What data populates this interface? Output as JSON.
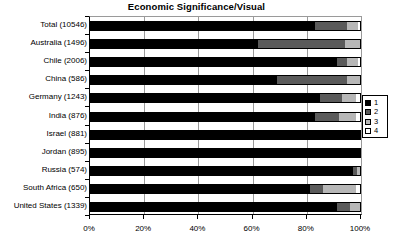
{
  "chart_data": {
    "type": "bar",
    "orientation": "horizontal",
    "stacked": true,
    "normalized_percent": true,
    "title": "Economic Significance/Visual",
    "xlabel": "",
    "ylabel": "",
    "xlim": [
      0,
      100
    ],
    "xticks": [
      0,
      20,
      40,
      60,
      80,
      100
    ],
    "xtick_labels": [
      "0%",
      "20%",
      "40%",
      "60%",
      "80%",
      "100%"
    ],
    "grid": true,
    "legend_position": "right",
    "legend_entries": [
      "1",
      "2",
      "3",
      "4"
    ],
    "series_colors": [
      "#000000",
      "#5a5a5a",
      "#b7b7b7",
      "#ffffff"
    ],
    "categories": [
      "Total (10546)",
      "Australia (1496)",
      "Chile (2006)",
      "China (586)",
      "Germany (1243)",
      "India (876)",
      "Israel (881)",
      "Jordan (895)",
      "Russia (574)",
      "South Africa (650)",
      "United States (1339)"
    ],
    "category_counts": [
      10546,
      1496,
      2006,
      586,
      1243,
      876,
      881,
      895,
      574,
      650,
      1339
    ],
    "series": [
      {
        "name": "1",
        "values": [
          83.0,
          62.0,
          91.0,
          69.0,
          85.0,
          83.0,
          99.5,
          99.5,
          97.0,
          81.0,
          91.0
        ]
      },
      {
        "name": "2",
        "values": [
          12.0,
          32.0,
          4.0,
          26.0,
          8.0,
          9.0,
          0.5,
          0.5,
          1.5,
          5.0,
          5.0
        ]
      },
      {
        "name": "3",
        "values": [
          4.0,
          6.0,
          4.0,
          5.0,
          5.0,
          6.0,
          0.0,
          0.0,
          1.0,
          12.0,
          3.5
        ]
      },
      {
        "name": "4",
        "values": [
          1.0,
          0.0,
          1.0,
          0.0,
          2.0,
          2.0,
          0.0,
          0.0,
          0.5,
          2.0,
          0.5
        ]
      }
    ]
  }
}
